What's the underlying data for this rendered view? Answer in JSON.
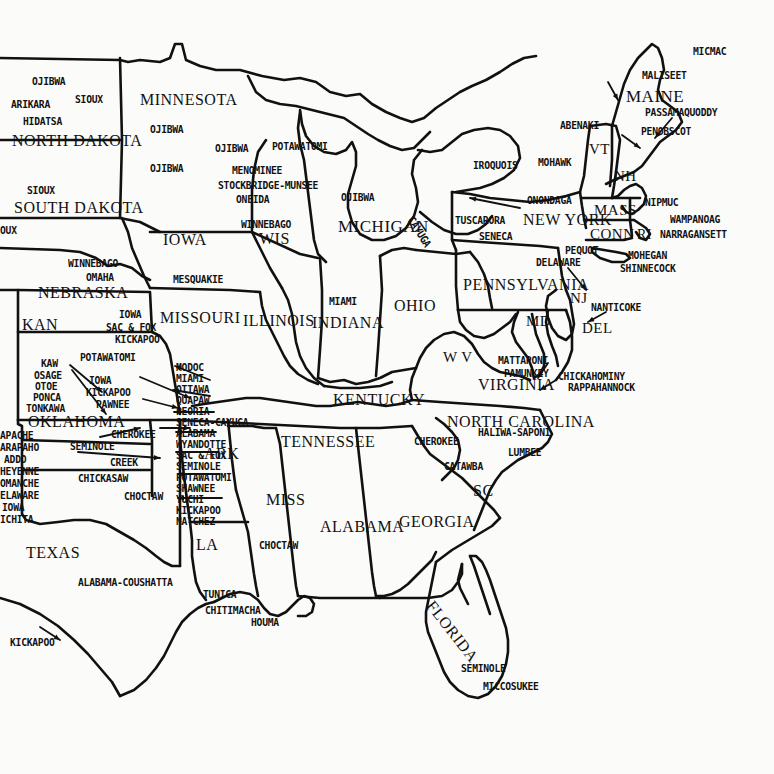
{
  "map": {
    "title": "Native American Tribes of the Eastern United States",
    "background_color": "#fbfbf9",
    "ink_color": "#111111",
    "width": 774,
    "height": 774
  },
  "states": [
    {
      "name": "MINNESOTA",
      "x": 140,
      "y": 92,
      "size": 16
    },
    {
      "name": "NORTH DAKOTA",
      "x": 12,
      "y": 133,
      "size": 16
    },
    {
      "name": "SOUTH DAKOTA",
      "x": 14,
      "y": 200,
      "size": 16
    },
    {
      "name": "IOWA",
      "x": 163,
      "y": 232,
      "size": 16
    },
    {
      "name": "WIS",
      "x": 259,
      "y": 231,
      "size": 16
    },
    {
      "name": "MICHIGAN",
      "x": 338,
      "y": 218,
      "size": 17
    },
    {
      "name": "NEBRASKA",
      "x": 38,
      "y": 285,
      "size": 16
    },
    {
      "name": "KAN",
      "x": 22,
      "y": 317,
      "size": 16
    },
    {
      "name": "MISSOURI",
      "x": 160,
      "y": 310,
      "size": 16
    },
    {
      "name": "ILLINOIS",
      "x": 243,
      "y": 313,
      "size": 16
    },
    {
      "name": "INDIANA",
      "x": 312,
      "y": 315,
      "size": 16
    },
    {
      "name": "OHIO",
      "x": 394,
      "y": 298,
      "size": 16
    },
    {
      "name": "PENNSYLVANIA",
      "x": 463,
      "y": 277,
      "size": 16
    },
    {
      "name": "NEW YORK",
      "x": 523,
      "y": 212,
      "size": 16
    },
    {
      "name": "MAINE",
      "x": 626,
      "y": 88,
      "size": 17
    },
    {
      "name": "VT",
      "x": 589,
      "y": 142,
      "size": 15
    },
    {
      "name": "NH",
      "x": 614,
      "y": 169,
      "size": 15
    },
    {
      "name": "MASS",
      "x": 594,
      "y": 203,
      "size": 15
    },
    {
      "name": "CONN",
      "x": 590,
      "y": 227,
      "size": 15
    },
    {
      "name": "RI",
      "x": 637,
      "y": 228,
      "size": 14
    },
    {
      "name": "NJ",
      "x": 570,
      "y": 291,
      "size": 15
    },
    {
      "name": "MD",
      "x": 526,
      "y": 314,
      "size": 15
    },
    {
      "name": "DEL",
      "x": 582,
      "y": 321,
      "size": 15
    },
    {
      "name": "W V",
      "x": 443,
      "y": 350,
      "size": 15
    },
    {
      "name": "VIRGINIA",
      "x": 478,
      "y": 377,
      "size": 16
    },
    {
      "name": "KENTUCKY",
      "x": 333,
      "y": 392,
      "size": 16
    },
    {
      "name": "NORTH CAROLINA",
      "x": 447,
      "y": 414,
      "size": 16
    },
    {
      "name": "TENNESSEE",
      "x": 281,
      "y": 434,
      "size": 16
    },
    {
      "name": "ARK",
      "x": 204,
      "y": 446,
      "size": 16
    },
    {
      "name": "SC",
      "x": 473,
      "y": 483,
      "size": 16
    },
    {
      "name": "OKLAHOMA",
      "x": 28,
      "y": 414,
      "size": 16
    },
    {
      "name": "MISS",
      "x": 266,
      "y": 492,
      "size": 16
    },
    {
      "name": "ALABAMA",
      "x": 320,
      "y": 519,
      "size": 16
    },
    {
      "name": "GEORGIA",
      "x": 399,
      "y": 514,
      "size": 16
    },
    {
      "name": "LA",
      "x": 196,
      "y": 537,
      "size": 16
    },
    {
      "name": "TEXAS",
      "x": 26,
      "y": 545,
      "size": 16
    },
    {
      "name": "FLORIDA",
      "x": 436,
      "y": 598,
      "size": 16,
      "rotate": 52
    }
  ],
  "tribes": [
    {
      "name": "OJIBWA",
      "x": 32,
      "y": 76
    },
    {
      "name": "SIOUX",
      "x": 75,
      "y": 94
    },
    {
      "name": "ARIKARA",
      "x": 11,
      "y": 99
    },
    {
      "name": "HIDATSA",
      "x": 23,
      "y": 116
    },
    {
      "name": "OJIBWA",
      "x": 150,
      "y": 124
    },
    {
      "name": "OJIBWA",
      "x": 150,
      "y": 163
    },
    {
      "name": "OJIBWA",
      "x": 215,
      "y": 143
    },
    {
      "name": "POTAWATOMI",
      "x": 272,
      "y": 141
    },
    {
      "name": "MENOMINEE",
      "x": 232,
      "y": 165
    },
    {
      "name": "STOCKBRIDGE-MUNSEE",
      "x": 218,
      "y": 180
    },
    {
      "name": "ONEIDA",
      "x": 236,
      "y": 194
    },
    {
      "name": "OJIBWA",
      "x": 341,
      "y": 192
    },
    {
      "name": "SIOUX",
      "x": 27,
      "y": 185
    },
    {
      "name": "OUX",
      "x": 0,
      "y": 225
    },
    {
      "name": "WINNEBAGO",
      "x": 241,
      "y": 219
    },
    {
      "name": "WINNEBAGO",
      "x": 68,
      "y": 258
    },
    {
      "name": "OMAHA",
      "x": 86,
      "y": 272
    },
    {
      "name": "MESQUAKIE",
      "x": 173,
      "y": 274
    },
    {
      "name": "IOWA",
      "x": 119,
      "y": 309
    },
    {
      "name": "SAC & FOX",
      "x": 106,
      "y": 322
    },
    {
      "name": "KICKAPOO",
      "x": 115,
      "y": 334
    },
    {
      "name": "POTAWATOMI",
      "x": 80,
      "y": 352
    },
    {
      "name": "KAW",
      "x": 41,
      "y": 358
    },
    {
      "name": "OSAGE",
      "x": 34,
      "y": 370
    },
    {
      "name": "OTOE",
      "x": 35,
      "y": 381
    },
    {
      "name": "PONCA",
      "x": 33,
      "y": 392
    },
    {
      "name": "TONKAWA",
      "x": 26,
      "y": 403
    },
    {
      "name": "IOWA",
      "x": 89,
      "y": 375
    },
    {
      "name": "KICKAPOO",
      "x": 86,
      "y": 387
    },
    {
      "name": "PAWNEE",
      "x": 96,
      "y": 399
    },
    {
      "name": "MODOC",
      "x": 176,
      "y": 362
    },
    {
      "name": "MIAMI",
      "x": 176,
      "y": 373
    },
    {
      "name": "OTTAWA",
      "x": 176,
      "y": 384
    },
    {
      "name": "QUAPAW",
      "x": 176,
      "y": 395
    },
    {
      "name": "PEORIA",
      "x": 176,
      "y": 406
    },
    {
      "name": "SENECA-CAYUGA",
      "x": 176,
      "y": 417
    },
    {
      "name": "ALABAMA",
      "x": 176,
      "y": 428
    },
    {
      "name": "WYANDOTTE",
      "x": 176,
      "y": 439
    },
    {
      "name": "SAC & FOX",
      "x": 176,
      "y": 450
    },
    {
      "name": "SEMINOLE",
      "x": 176,
      "y": 461
    },
    {
      "name": "POTAWATOMI",
      "x": 176,
      "y": 472
    },
    {
      "name": "SHAWNEE",
      "x": 176,
      "y": 483
    },
    {
      "name": "YUCHI",
      "x": 176,
      "y": 494
    },
    {
      "name": "KICKAPOO",
      "x": 176,
      "y": 505
    },
    {
      "name": "NATCHEZ",
      "x": 176,
      "y": 516
    },
    {
      "name": "APACHE",
      "x": 0,
      "y": 430
    },
    {
      "name": "ARAPAHO",
      "x": 0,
      "y": 442
    },
    {
      "name": "ADDO",
      "x": 4,
      "y": 454
    },
    {
      "name": "HEYENNE",
      "x": 0,
      "y": 466
    },
    {
      "name": "OMANCHE",
      "x": 0,
      "y": 478
    },
    {
      "name": "ELAWARE",
      "x": 0,
      "y": 490
    },
    {
      "name": "IOWA",
      "x": 2,
      "y": 502
    },
    {
      "name": "ICHITA",
      "x": 0,
      "y": 514
    },
    {
      "name": "CHEROKEE",
      "x": 111,
      "y": 429
    },
    {
      "name": "SEMINOLE",
      "x": 70,
      "y": 441
    },
    {
      "name": "CREEK",
      "x": 110,
      "y": 457
    },
    {
      "name": "CHICKASAW",
      "x": 78,
      "y": 473
    },
    {
      "name": "CHOCTAW",
      "x": 124,
      "y": 491
    },
    {
      "name": "MIAMI",
      "x": 329,
      "y": 296
    },
    {
      "name": "IROQUOIS",
      "x": 473,
      "y": 160
    },
    {
      "name": "MOHAWK",
      "x": 538,
      "y": 157
    },
    {
      "name": "ABENAKI",
      "x": 560,
      "y": 120
    },
    {
      "name": "MICMAC",
      "x": 693,
      "y": 46
    },
    {
      "name": "MALISEET",
      "x": 642,
      "y": 70
    },
    {
      "name": "PASSAMAQUODDY",
      "x": 645,
      "y": 107
    },
    {
      "name": "PENOBSCOT",
      "x": 641,
      "y": 126
    },
    {
      "name": "ONONDAGA",
      "x": 527,
      "y": 195
    },
    {
      "name": "TUSCARORA",
      "x": 455,
      "y": 215
    },
    {
      "name": "SENECA",
      "x": 479,
      "y": 231
    },
    {
      "name": "CAYUGA",
      "x": 415,
      "y": 215,
      "rotate": 58
    },
    {
      "name": "NIPMUC",
      "x": 645,
      "y": 197
    },
    {
      "name": "WAMPANOAG",
      "x": 670,
      "y": 214
    },
    {
      "name": "NARRAGANSETT",
      "x": 660,
      "y": 229
    },
    {
      "name": "PEQUOT",
      "x": 565,
      "y": 245
    },
    {
      "name": "MOHEGAN",
      "x": 628,
      "y": 250
    },
    {
      "name": "SHINNECOCK",
      "x": 620,
      "y": 263
    },
    {
      "name": "DELAWARE",
      "x": 536,
      "y": 257
    },
    {
      "name": "NANTICOKE",
      "x": 591,
      "y": 302
    },
    {
      "name": "MATTAPONI",
      "x": 498,
      "y": 355
    },
    {
      "name": "PAMUNKEY",
      "x": 504,
      "y": 368
    },
    {
      "name": "CHICKAHOMINY",
      "x": 558,
      "y": 371
    },
    {
      "name": "RAPPAHANNOCK",
      "x": 568,
      "y": 382
    },
    {
      "name": "HALIWA-SAPONI",
      "x": 478,
      "y": 427
    },
    {
      "name": "CHEROKEE",
      "x": 414,
      "y": 436
    },
    {
      "name": "LUMBEE",
      "x": 508,
      "y": 447
    },
    {
      "name": "CATAWBA",
      "x": 444,
      "y": 461
    },
    {
      "name": "CHOCTAW",
      "x": 259,
      "y": 540
    },
    {
      "name": "ALABAMA-COUSHATTA",
      "x": 78,
      "y": 577
    },
    {
      "name": "TUNICA",
      "x": 203,
      "y": 589
    },
    {
      "name": "CHITIMACHA",
      "x": 205,
      "y": 605
    },
    {
      "name": "HOUMA",
      "x": 251,
      "y": 617
    },
    {
      "name": "KICKAPOO",
      "x": 10,
      "y": 637
    },
    {
      "name": "SEMINOLE",
      "x": 461,
      "y": 663
    },
    {
      "name": "MICCOSUKEE",
      "x": 483,
      "y": 681
    }
  ],
  "leaders": [
    {
      "from": [
        70,
        365
      ],
      "to": [
        102,
        392
      ]
    },
    {
      "from": [
        72,
        370
      ],
      "to": [
        106,
        414
      ]
    },
    {
      "from": [
        140,
        377
      ],
      "to": [
        190,
        398
      ]
    },
    {
      "from": [
        143,
        399
      ],
      "to": [
        178,
        408
      ]
    },
    {
      "from": [
        210,
        380
      ],
      "to": [
        175,
        366
      ]
    },
    {
      "from": [
        210,
        396
      ],
      "to": [
        173,
        390
      ]
    },
    {
      "from": [
        214,
        412
      ],
      "to": [
        174,
        412
      ]
    },
    {
      "from": [
        216,
        432
      ],
      "to": [
        176,
        432
      ]
    },
    {
      "from": [
        218,
        452
      ],
      "to": [
        176,
        452
      ]
    },
    {
      "from": [
        220,
        474
      ],
      "to": [
        178,
        474
      ]
    },
    {
      "from": [
        222,
        498
      ],
      "to": [
        178,
        498
      ]
    },
    {
      "from": [
        160,
        428
      ],
      "to": [
        190,
        428
      ]
    },
    {
      "from": [
        78,
        452
      ],
      "to": [
        160,
        458
      ]
    },
    {
      "from": [
        100,
        437
      ],
      "to": [
        140,
        428
      ]
    },
    {
      "from": [
        520,
        208
      ],
      "to": [
        470,
        198
      ]
    },
    {
      "from": [
        608,
        82
      ],
      "to": [
        618,
        100
      ]
    },
    {
      "from": [
        672,
        118
      ],
      "to": [
        655,
        138
      ]
    },
    {
      "from": [
        622,
        135
      ],
      "to": [
        640,
        148
      ]
    },
    {
      "from": [
        568,
        268
      ],
      "to": [
        586,
        290
      ]
    },
    {
      "from": [
        606,
        312
      ],
      "to": [
        588,
        322
      ]
    },
    {
      "from": [
        548,
        363
      ],
      "to": [
        538,
        378
      ]
    },
    {
      "from": [
        556,
        380
      ],
      "to": [
        540,
        390
      ]
    },
    {
      "from": [
        40,
        627
      ],
      "to": [
        60,
        640
      ]
    }
  ]
}
